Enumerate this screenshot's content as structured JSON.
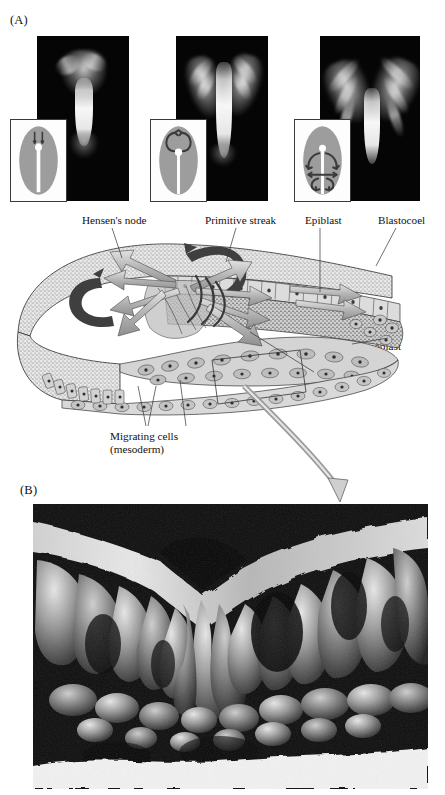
{
  "figure": {
    "panels": [
      {
        "letter": "(A)"
      },
      {
        "letter": "(B)"
      }
    ]
  },
  "panel_a": {
    "letter": "(A)",
    "photographs": [
      {
        "name": "stage-1-early-streak",
        "inset_caption": "",
        "description": "fluorescent-labeled cells at early primitive streak"
      },
      {
        "name": "stage-2-mid-streak",
        "inset_caption": "",
        "description": "fluorescent-labeled cells spreading laterally"
      },
      {
        "name": "stage-3-late-streak",
        "inset_caption": "",
        "description": "fluorescent-labeled cells migrating widely"
      }
    ],
    "diagram_labels": {
      "hensens_node": "Hensen's node",
      "primitive_streak": "Primitive streak",
      "epiblast": "Epiblast",
      "blastocoel": "Blastocoel",
      "hypoblast": "Hypoblast",
      "endoderm": "Endoderm",
      "migrating_cells_line1": "Migrating cells",
      "migrating_cells_line2": "(mesoderm)"
    }
  },
  "panel_b": {
    "letter": "(B)",
    "description": "scanning electron micrograph of primitive streak cross-section"
  },
  "colors": {
    "page_background": "#ffffff",
    "text": "#111111",
    "photo_background": "#050505",
    "inset_embryo_fill": "#9d9d9d",
    "inset_border": "#3a3a3a",
    "arrow_gray": "#a8a8a8",
    "arrow_dark": "#3f3f3f",
    "epiblast_stipple": "#8a8a8a",
    "leader_line": "#333333"
  }
}
